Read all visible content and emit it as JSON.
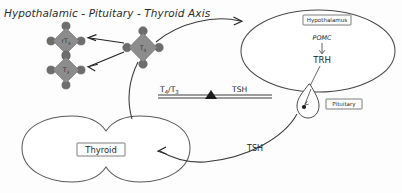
{
  "title": "Hypothalamic - Pituitary - Thyroid Axis",
  "colors": {
    "molecule_body": "#8c8c8c",
    "molecule_node": "#6d6d6d",
    "outline": "#4a4a4a",
    "arrow": "#333333",
    "text": "#1f1f1f",
    "background": "#fdfdfd"
  },
  "organs": {
    "hypothalamus": {
      "label": "Hypothalamus",
      "contents": {
        "precursor": "POMC",
        "hormone": "TRH"
      }
    },
    "pituitary": {
      "label": "Pituitary"
    },
    "thyroid": {
      "label": "Thyroid"
    }
  },
  "molecules": [
    {
      "id": "rt3",
      "label": "rT",
      "subscript": "3"
    },
    {
      "id": "t3",
      "label": "T",
      "subscript": "3"
    },
    {
      "id": "t4",
      "label": "T",
      "subscript": "4"
    }
  ],
  "balance": {
    "left_label": "T",
    "left_sub_1": "4",
    "left_mid": "/T",
    "left_sub_2": "3",
    "right_label": "TSH"
  },
  "flows": {
    "tsh_to_thyroid": "TSH"
  }
}
